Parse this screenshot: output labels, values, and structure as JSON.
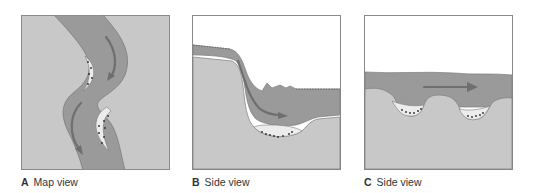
{
  "figure": {
    "panels": [
      {
        "id": "A",
        "letter": "A",
        "caption": "Map view"
      },
      {
        "id": "B",
        "letter": "B",
        "caption": "Side view"
      },
      {
        "id": "C",
        "letter": "C",
        "caption": "Side view"
      }
    ]
  },
  "colors": {
    "land": "#c8c8c8",
    "water": "#9a9a9a",
    "sediment": "#ececec",
    "arrow": "#6f6f6f",
    "sediment_dots": "#2a2a2a",
    "border": "#8a8a8a",
    "sky": "#ffffff"
  }
}
